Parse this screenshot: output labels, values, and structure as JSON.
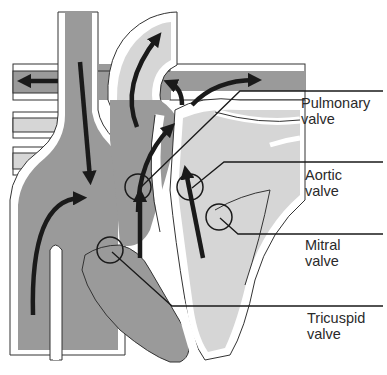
{
  "diagram": {
    "colors": {
      "deoxygenated_fill": "#9a9a9a",
      "oxygenated_fill": "#d6d6d6",
      "wall_fill": "#ffffff",
      "outline": "#333333",
      "arrow": "#1a1a1a",
      "background": "#ffffff"
    }
  },
  "labels": {
    "pulmonary": {
      "line1": "Pulmonary",
      "line2": "valve"
    },
    "aortic": {
      "line1": "Aortic",
      "line2": "valve"
    },
    "mitral": {
      "line1": "Mitral",
      "line2": "valve"
    },
    "tricuspid": {
      "line1": "Tricuspid",
      "line2": "valve"
    }
  }
}
